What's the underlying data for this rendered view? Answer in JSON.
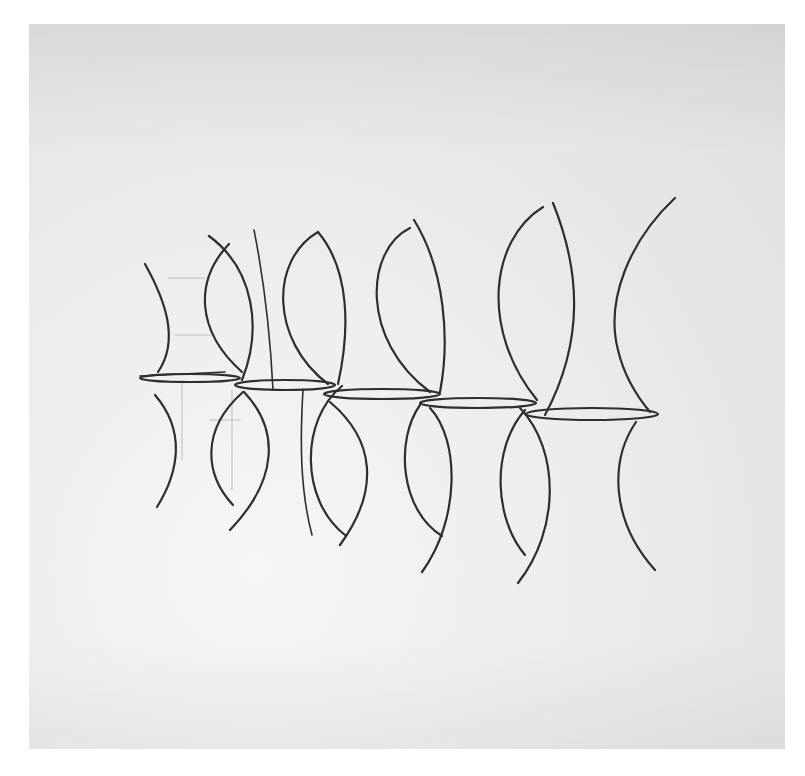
{
  "artwork": {
    "medium": "pencil sketch on paper",
    "subject": "row of five vase / hourglass forms with elliptical rims",
    "colors": {
      "page_background": "#ffffff",
      "paper": "#e9e9e9",
      "stroke_dark": "#2b2b2b",
      "stroke_light": "#b9b9b9"
    },
    "paper_bounds": {
      "x": 29,
      "y": 24,
      "width": 756,
      "height": 725
    },
    "forms": [
      {
        "id": 1,
        "rim": {
          "cx": 190,
          "cy": 378,
          "rx": 50,
          "ry": 4
        }
      },
      {
        "id": 2,
        "rim": {
          "cx": 285,
          "cy": 385,
          "rx": 50,
          "ry": 5
        }
      },
      {
        "id": 3,
        "rim": {
          "cx": 382,
          "cy": 394,
          "rx": 58,
          "ry": 5
        }
      },
      {
        "id": 4,
        "rim": {
          "cx": 478,
          "cy": 403,
          "rx": 58,
          "ry": 5
        }
      },
      {
        "id": 5,
        "rim": {
          "cx": 592,
          "cy": 414,
          "rx": 66,
          "ry": 6
        }
      }
    ]
  }
}
